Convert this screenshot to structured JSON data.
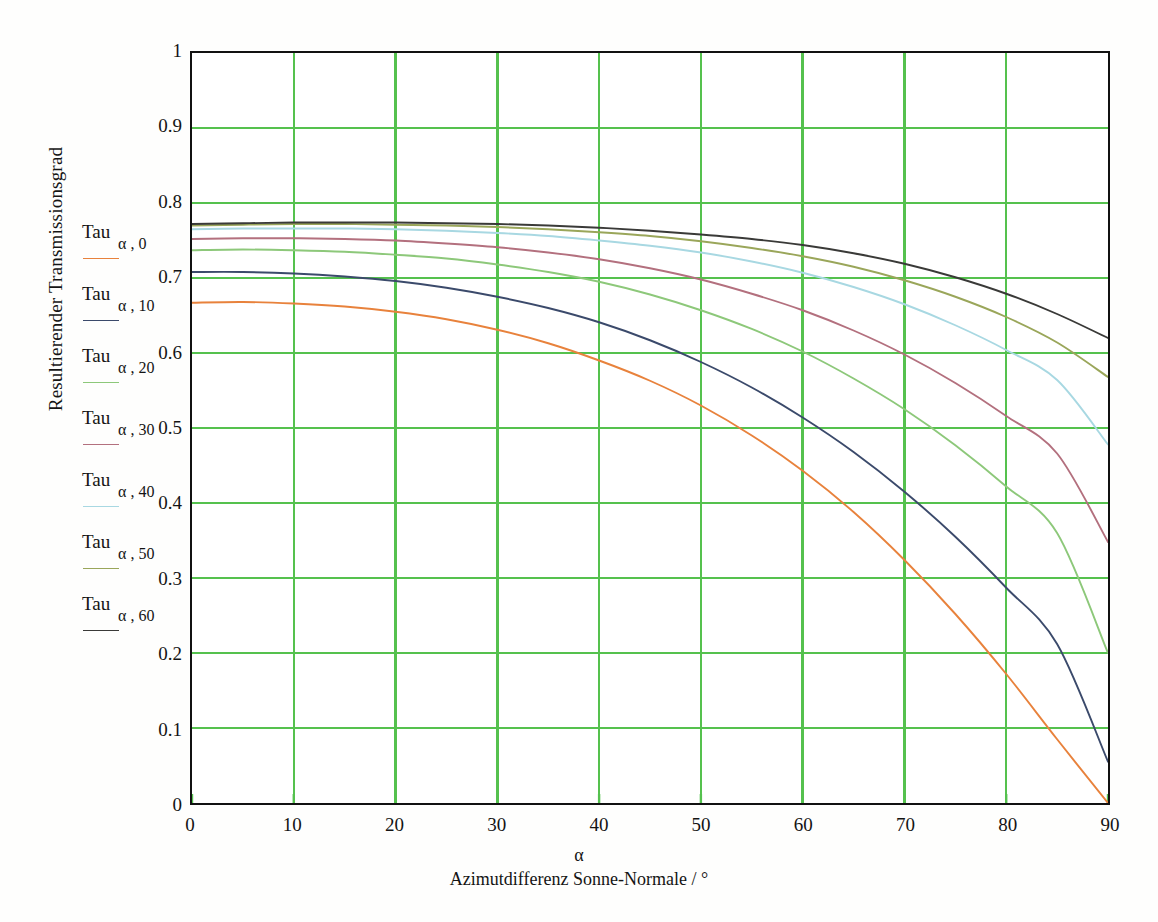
{
  "axes": {
    "ylabel": "Resultierender Transmissionsgrad",
    "xlabel_symbol": "α",
    "xlabel_text": "Azimutdifferenz Sonne-Normale / °",
    "ytick_labels": [
      "1",
      "0.9",
      "0.8",
      "0.7",
      "0.6",
      "0.5",
      "0.4",
      "0.3",
      "0.2",
      "0.1",
      "0"
    ],
    "xtick_labels": [
      "0",
      "10",
      "20",
      "30",
      "40",
      "50",
      "60",
      "70",
      "80",
      "90"
    ],
    "grid_color": "#55c14e",
    "frame_color": "#111111"
  },
  "legend": {
    "entries": [
      {
        "name": "Tau",
        "sub": "α , 0",
        "color": "#e8823c"
      },
      {
        "name": "Tau",
        "sub": "α , 10",
        "color": "#3b4a6b"
      },
      {
        "name": "Tau",
        "sub": "α , 20",
        "color": "#8dc87a"
      },
      {
        "name": "Tau",
        "sub": "α , 30",
        "color": "#b3707e"
      },
      {
        "name": "Tau",
        "sub": "α , 40",
        "color": "#a8d8e2"
      },
      {
        "name": "Tau",
        "sub": "α , 50",
        "color": "#9aa65a"
      },
      {
        "name": "Tau",
        "sub": "α , 60",
        "color": "#3a3a38"
      }
    ]
  },
  "chart_data": {
    "type": "line",
    "title": "",
    "xlabel": "α  Azimutdifferenz Sonne-Normale / °",
    "ylabel": "Resultierender Transmissionsgrad",
    "xlim": [
      0,
      90
    ],
    "ylim": [
      0,
      1
    ],
    "grid": true,
    "legend_position": "left-outside",
    "x": [
      0,
      5,
      10,
      15,
      20,
      25,
      30,
      35,
      40,
      45,
      50,
      55,
      60,
      65,
      70,
      75,
      80,
      85,
      90
    ],
    "series": [
      {
        "name": "Tau α,0",
        "color": "#e8823c",
        "values": [
          0.667,
          0.668,
          0.666,
          0.662,
          0.655,
          0.645,
          0.631,
          0.613,
          0.59,
          0.563,
          0.53,
          0.49,
          0.443,
          0.388,
          0.324,
          0.252,
          0.172,
          0.085,
          0.0
        ]
      },
      {
        "name": "Tau α,10",
        "color": "#3b4a6b",
        "values": [
          0.708,
          0.708,
          0.706,
          0.702,
          0.696,
          0.687,
          0.675,
          0.66,
          0.641,
          0.617,
          0.588,
          0.554,
          0.514,
          0.468,
          0.415,
          0.355,
          0.287,
          0.212,
          0.055
        ]
      },
      {
        "name": "Tau α,20",
        "color": "#8dc87a",
        "values": [
          0.737,
          0.738,
          0.737,
          0.735,
          0.731,
          0.726,
          0.718,
          0.708,
          0.695,
          0.678,
          0.657,
          0.632,
          0.602,
          0.566,
          0.525,
          0.477,
          0.422,
          0.36,
          0.2
        ]
      },
      {
        "name": "Tau α,30",
        "color": "#b3707e",
        "values": [
          0.752,
          0.753,
          0.753,
          0.752,
          0.75,
          0.746,
          0.741,
          0.734,
          0.725,
          0.713,
          0.698,
          0.679,
          0.657,
          0.63,
          0.598,
          0.56,
          0.516,
          0.466,
          0.348
        ]
      },
      {
        "name": "Tau α,40",
        "color": "#a8d8e2",
        "values": [
          0.765,
          0.766,
          0.766,
          0.766,
          0.765,
          0.763,
          0.76,
          0.756,
          0.75,
          0.743,
          0.734,
          0.722,
          0.707,
          0.688,
          0.665,
          0.637,
          0.604,
          0.564,
          0.478
        ]
      },
      {
        "name": "Tau α,50",
        "color": "#9aa65a",
        "values": [
          0.77,
          0.771,
          0.772,
          0.772,
          0.771,
          0.77,
          0.768,
          0.765,
          0.761,
          0.756,
          0.749,
          0.74,
          0.729,
          0.715,
          0.697,
          0.675,
          0.648,
          0.614,
          0.568
        ]
      },
      {
        "name": "Tau α,60",
        "color": "#3a3a38",
        "values": [
          0.772,
          0.773,
          0.774,
          0.774,
          0.774,
          0.773,
          0.772,
          0.77,
          0.767,
          0.763,
          0.758,
          0.752,
          0.744,
          0.733,
          0.719,
          0.701,
          0.679,
          0.652,
          0.62
        ]
      }
    ]
  }
}
